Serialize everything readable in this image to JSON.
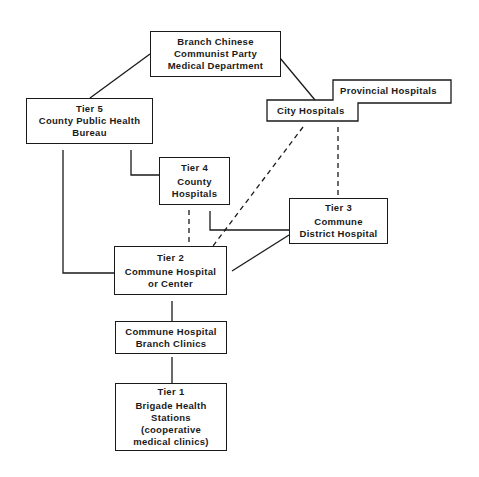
{
  "diagram": {
    "type": "organizational-hierarchy",
    "nodes": {
      "party": {
        "lines": [
          "Branch Chinese",
          "Communist Party",
          "Medical Department"
        ]
      },
      "tier5": {
        "tier": "Tier 5",
        "lines": [
          "County Public Health",
          "Bureau"
        ]
      },
      "city": {
        "label": "City Hospitals"
      },
      "provincial": {
        "label": "Provincial Hospitals"
      },
      "tier4": {
        "tier": "Tier 4",
        "lines": [
          "County",
          "Hospitals"
        ]
      },
      "tier3": {
        "tier": "Tier 3",
        "lines": [
          "Commune",
          "District Hospital"
        ]
      },
      "tier2": {
        "tier": "Tier 2",
        "lines": [
          "Commune Hospital",
          "or Center"
        ]
      },
      "branch": {
        "lines": [
          "Commune Hospital",
          "Branch Clinics"
        ]
      },
      "tier1": {
        "tier": "Tier 1",
        "lines": [
          "Brigade Health",
          "Stations",
          "(cooperative",
          "medical clinics)"
        ]
      }
    },
    "edges": [
      {
        "from": "party",
        "to": "tier5",
        "style": "solid"
      },
      {
        "from": "party",
        "to": "city",
        "style": "solid"
      },
      {
        "from": "tier5",
        "to": "tier2",
        "style": "solid"
      },
      {
        "from": "tier5",
        "to": "tier4",
        "style": "solid"
      },
      {
        "from": "tier4",
        "to": "tier2",
        "style": "dashed"
      },
      {
        "from": "tier4",
        "to": "tier3",
        "style": "solid"
      },
      {
        "from": "city",
        "to": "tier2",
        "style": "dashed"
      },
      {
        "from": "city",
        "to": "tier3",
        "style": "dashed"
      },
      {
        "from": "tier3",
        "to": "tier2",
        "style": "solid"
      },
      {
        "from": "tier2",
        "to": "branch",
        "style": "solid"
      },
      {
        "from": "branch",
        "to": "tier1",
        "style": "solid"
      }
    ],
    "colors": {
      "ink": "#1a1a1a",
      "background": "#ffffff"
    }
  }
}
